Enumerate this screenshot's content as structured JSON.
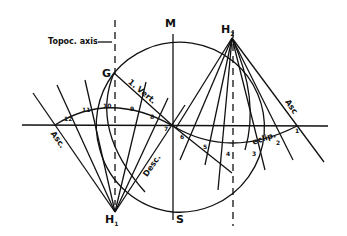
{
  "diagram": {
    "labels": {
      "topoc_axis": "Topoc. axis",
      "arrow": "→",
      "M": "M",
      "S": "S",
      "G": "G",
      "H1": "H",
      "H1_sub": "1",
      "H2": "H",
      "H2_sub": "2",
      "asc_left": "Asc.",
      "asc_right": "Asc",
      "desc": "Desc.",
      "eclip": "eclip.",
      "first_vert": "1. Vert."
    },
    "house_numbers": [
      "1",
      "2",
      "3",
      "4",
      "5",
      "6",
      "7",
      "8",
      "9",
      "10",
      "11",
      "12"
    ],
    "colors": {
      "ink": "#111111",
      "background": "#ffffff"
    }
  }
}
